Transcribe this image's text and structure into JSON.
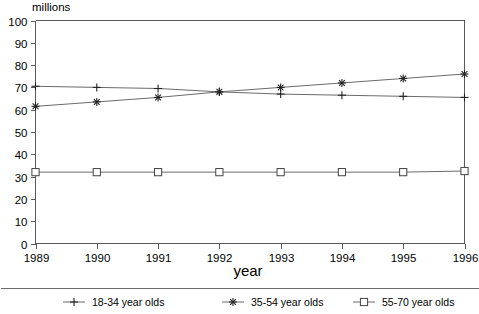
{
  "chart_data": {
    "type": "line",
    "title": "",
    "xlabel": "year",
    "ylabel": "millions",
    "unit_label": "millions",
    "categories": [
      1989,
      1990,
      1991,
      1992,
      1993,
      1994,
      1995,
      1996
    ],
    "x": [
      "1989",
      "1990",
      "1991",
      "1992",
      "1993",
      "1994",
      "1995",
      "1996"
    ],
    "xlim": [
      1989,
      1996
    ],
    "ylim": [
      0,
      100
    ],
    "ytick_step": 10,
    "yticks": [
      "0",
      "10",
      "20",
      "30",
      "40",
      "50",
      "60",
      "70",
      "80",
      "90",
      "100"
    ],
    "grid": false,
    "legend_position": "bottom",
    "series": [
      {
        "name": "18-34 year olds",
        "marker": "plus",
        "color": "#6b6b6b",
        "values": [
          70.5,
          70.0,
          69.5,
          68.0,
          67.0,
          66.5,
          66.0,
          65.5
        ]
      },
      {
        "name": "35-54 year olds",
        "marker": "star",
        "color": "#6b6b6b",
        "values": [
          61.5,
          63.5,
          65.5,
          68.0,
          70.0,
          72.0,
          74.0,
          76.0
        ]
      },
      {
        "name": "55-70 year olds",
        "marker": "square",
        "color": "#6b6b6b",
        "values": [
          32.0,
          32.0,
          32.0,
          32.0,
          32.0,
          32.0,
          32.0,
          32.5
        ]
      }
    ]
  },
  "legend": {
    "entries": [
      {
        "label": "18-34 year olds",
        "marker": "plus"
      },
      {
        "label": "35-54 year olds",
        "marker": "star"
      },
      {
        "label": "55-70 year olds",
        "marker": "square"
      }
    ]
  }
}
